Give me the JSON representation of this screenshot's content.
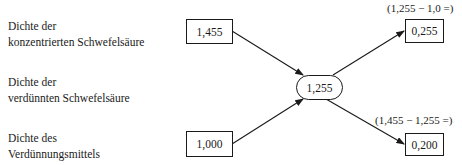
{
  "labels": {
    "conc": [
      "Dichte der",
      "konzentrierten Schwefelsäure"
    ],
    "dilute": [
      "Dichte der",
      "verdünnten Schwefelsäure"
    ],
    "diluent": [
      "Dichte des",
      "Verdünnungsmittels"
    ]
  },
  "values": {
    "conc_density": "1,455",
    "diluent_density": "1,000",
    "target_density": "1,255",
    "parts_conc": "0,255",
    "parts_diluent": "0,200"
  },
  "formulas": {
    "top": "(1,255 − 1,0 =)",
    "bottom": "(1,455 − 1,255 =)"
  }
}
